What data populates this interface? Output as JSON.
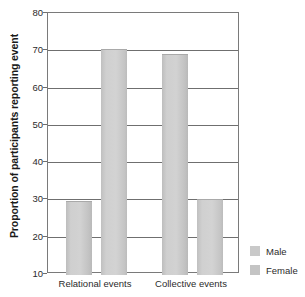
{
  "chart_data": {
    "type": "bar",
    "title": "",
    "xlabel": "",
    "ylabel": "Proportion of participants reporting event",
    "categories": [
      "Relational events",
      "Collective events"
    ],
    "series": [
      {
        "name": "Male",
        "values": [
          29.5,
          69.0
        ],
        "color": "#c9c9c9"
      },
      {
        "name": "Female",
        "values": [
          70.3,
          30.0
        ],
        "color": "#c4c4c4"
      }
    ],
    "ylim": [
      10,
      80
    ],
    "yticks": [
      10,
      20,
      30,
      40,
      50,
      60,
      70,
      80
    ],
    "ytick_labels": [
      "10",
      "20",
      "30",
      "40",
      "50",
      "60",
      "70",
      "80"
    ],
    "grid": true,
    "grid_axis": "y",
    "legend_position": "right-bottom"
  },
  "legend": {
    "entries": [
      {
        "label": "Male"
      },
      {
        "label": "Female"
      }
    ]
  },
  "axes": {
    "y_title": "Proportion of participants reporting event",
    "x_labels": [
      "Relational events",
      "Collective events"
    ]
  }
}
